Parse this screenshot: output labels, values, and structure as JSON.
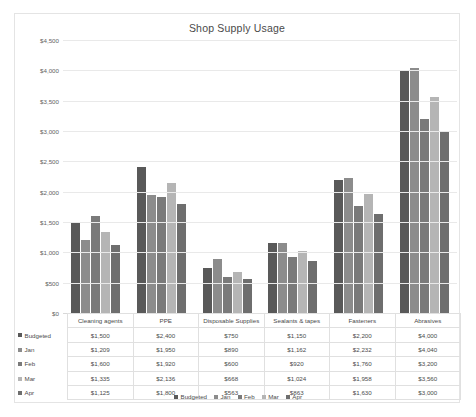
{
  "chart_data": {
    "type": "bar",
    "title": "Shop Supply Usage",
    "xlabel": "",
    "ylabel": "",
    "ylim": [
      0,
      4500
    ],
    "ytick_step": 500,
    "grid": true,
    "legend_position": "bottom",
    "ytick_labels": [
      "$4,500",
      "$4,000",
      "$3,500",
      "$3,000",
      "$2,500",
      "$2,000",
      "$1,500",
      "$1,000",
      "$500",
      "$0"
    ],
    "ytick_values": [
      4500,
      4000,
      3500,
      3000,
      2500,
      2000,
      1500,
      1000,
      500,
      0
    ],
    "categories": [
      "Cleaning agents",
      "PPE",
      "Disposable Supplies",
      "Sealants & tapes",
      "Fasteners",
      "Abrasives"
    ],
    "series": [
      {
        "name": "Budgeted",
        "color": "#595959",
        "values": [
          1500,
          2400,
          750,
          1150,
          2200,
          4000
        ],
        "labels": [
          "$1,500",
          "$2,400",
          "$750",
          "$1,150",
          "$2,200",
          "$4,000"
        ]
      },
      {
        "name": "Jan",
        "color": "#8c8c8c",
        "values": [
          1209,
          1950,
          890,
          1162,
          2232,
          4040
        ],
        "labels": [
          "$1,209",
          "$1,950",
          "$890",
          "$1,162",
          "$2,232",
          "$4,040"
        ]
      },
      {
        "name": "Feb",
        "color": "#7a7a7a",
        "values": [
          1600,
          1920,
          600,
          920,
          1760,
          3200
        ],
        "labels": [
          "$1,600",
          "$1,920",
          "$600",
          "$920",
          "$1,760",
          "$3,200"
        ]
      },
      {
        "name": "Mar",
        "color": "#b5b5b5",
        "values": [
          1335,
          2136,
          668,
          1024,
          1958,
          3560
        ],
        "labels": [
          "$1,335",
          "$2,136",
          "$668",
          "$1,024",
          "$1,958",
          "$3,560"
        ]
      },
      {
        "name": "Apr",
        "color": "#6e6e6e",
        "values": [
          1125,
          1800,
          563,
          863,
          1630,
          3000
        ],
        "labels": [
          "$1,125",
          "$1,800",
          "$563",
          "$863",
          "$1,630",
          "$3,000"
        ]
      }
    ]
  },
  "table": {
    "corner_label": "",
    "column_headers": [
      "Cleaning agents",
      "PPE",
      "Disposable Supplies",
      "Sealants & tapes",
      "Fasteners",
      "Abrasives"
    ],
    "rows": [
      {
        "label": "Budgeted",
        "color": "#595959",
        "cells": [
          "$1,500",
          "$2,400",
          "$750",
          "$1,150",
          "$2,200",
          "$4,000"
        ]
      },
      {
        "label": "Jan",
        "color": "#8c8c8c",
        "cells": [
          "$1,209",
          "$1,950",
          "$890",
          "$1,162",
          "$2,232",
          "$4,040"
        ]
      },
      {
        "label": "Feb",
        "color": "#7a7a7a",
        "cells": [
          "$1,600",
          "$1,920",
          "$600",
          "$920",
          "$1,760",
          "$3,200"
        ]
      },
      {
        "label": "Mar",
        "color": "#b5b5b5",
        "cells": [
          "$1,335",
          "$2,136",
          "$668",
          "$1,024",
          "$1,958",
          "$3,560"
        ]
      },
      {
        "label": "Apr",
        "color": "#6e6e6e",
        "cells": [
          "$1,125",
          "$1,800",
          "$563",
          "$863",
          "$1,630",
          "$3,000"
        ]
      }
    ]
  },
  "legend": {
    "items": [
      {
        "label": "Budgeted",
        "color": "#595959"
      },
      {
        "label": "Jan",
        "color": "#8c8c8c"
      },
      {
        "label": "Feb",
        "color": "#7a7a7a"
      },
      {
        "label": "Mar",
        "color": "#b5b5b5"
      },
      {
        "label": "Apr",
        "color": "#6e6e6e"
      }
    ]
  }
}
